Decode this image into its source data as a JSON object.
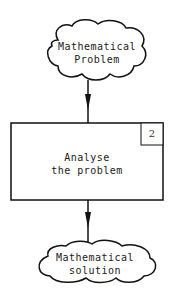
{
  "diagram": {
    "nodes": [
      {
        "id": "input",
        "shape": "cloud",
        "lines": [
          "Mathematical",
          "Problem"
        ]
      },
      {
        "id": "process",
        "shape": "rectangle",
        "number": "2",
        "lines": [
          "Analyse",
          "the problem"
        ]
      },
      {
        "id": "output",
        "shape": "cloud",
        "lines": [
          "Mathematical",
          "solution"
        ]
      }
    ],
    "edges": [
      {
        "from": "input",
        "to": "process"
      },
      {
        "from": "process",
        "to": "output"
      }
    ],
    "colors": {
      "stroke": "#111111",
      "background": "#ffffff"
    }
  }
}
